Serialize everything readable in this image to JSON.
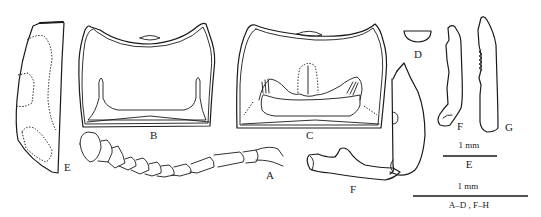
{
  "figure": {
    "type": "morphological illustration plate",
    "panels": [
      {
        "id": "A",
        "label": "A",
        "depicts": "antenna"
      },
      {
        "id": "B",
        "label": "B",
        "depicts": "pronotum / sclerite (dorsal)"
      },
      {
        "id": "C",
        "label": "C",
        "depicts": "sclerite with internal structures"
      },
      {
        "id": "D",
        "label": "D",
        "depicts": "small semicircular plate"
      },
      {
        "id": "E",
        "label": "E",
        "depicts": "elytron with dotted markings"
      },
      {
        "id": "F",
        "label": "F",
        "depicts": "genitalia (lateral)"
      },
      {
        "id": "G",
        "label": "G",
        "depicts": "paramere"
      },
      {
        "id": "H",
        "label": "H",
        "depicts": "paramere with serrate margin"
      }
    ],
    "scale_bars": [
      {
        "length_label": "1 mm",
        "applies_to": "E"
      },
      {
        "length_label": "1 mm",
        "applies_to": "A–D , F–H"
      }
    ],
    "colors": {
      "line": "#1a1a1a",
      "background": "#ffffff"
    }
  }
}
